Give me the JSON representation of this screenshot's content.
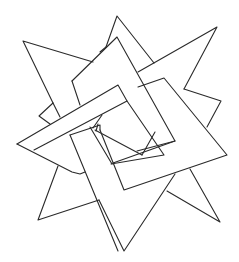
{
  "figure": {
    "stroke_color": "#2a2a2a",
    "background": "#ffffff",
    "polylines": [
      {
        "name": "star-arm-upper-left",
        "points": "93,62 23,41 53,103"
      },
      {
        "name": "star-arm-upper-left-inner",
        "points": "53,103 60,117"
      },
      {
        "name": "star-arm-top",
        "points": "106,47 117,16 154,63"
      },
      {
        "name": "star-arm-top-right",
        "points": "138,72 217,27 184,89"
      },
      {
        "name": "star-arm-right",
        "points": "184,89 221,101 207,127"
      },
      {
        "name": "star-arm-bottom-right",
        "points": "190,169 220,222 167,191"
      },
      {
        "name": "star-arm-bottom",
        "points": "175,174 124,251 99,200"
      },
      {
        "name": "star-arm-bottom-left",
        "points": "58,166 38,220 99,200"
      },
      {
        "name": "star-arm-left-small",
        "points": "53,103 39,116 50,124"
      },
      {
        "name": "frame-a-outer",
        "points": "72,81 117,37 175,141 137,151"
      },
      {
        "name": "frame-a-inner",
        "points": "72,81 80,105"
      },
      {
        "name": "frame-a-inner2",
        "points": "106,47 100,52"
      },
      {
        "name": "frame-b-outer",
        "points": "17,144 118,85 127,101 34,150"
      },
      {
        "name": "frame-b-lower",
        "points": "17,144 72,172 80,174 85,172"
      },
      {
        "name": "frame-c-outer",
        "points": "138,87 164,78 227,155 124,190 100,130"
      },
      {
        "name": "frame-c-inner",
        "points": "113,163 175,141"
      },
      {
        "name": "frame-c-inner2",
        "points": "127,101 164,155 111,164"
      },
      {
        "name": "frame-d-outer",
        "points": "70,135 100,125 100,130"
      },
      {
        "name": "frame-d-left",
        "points": "70,135 118,251"
      },
      {
        "name": "frame-d-right",
        "points": "90,127 112,164"
      },
      {
        "name": "center-inner-1",
        "points": "95,130 142,155"
      },
      {
        "name": "center-inner-2",
        "points": "142,155 155,132"
      },
      {
        "name": "center-small-1",
        "points": "98,124 96,131"
      },
      {
        "name": "center-small-2",
        "points": "102,115 93,128"
      }
    ]
  }
}
